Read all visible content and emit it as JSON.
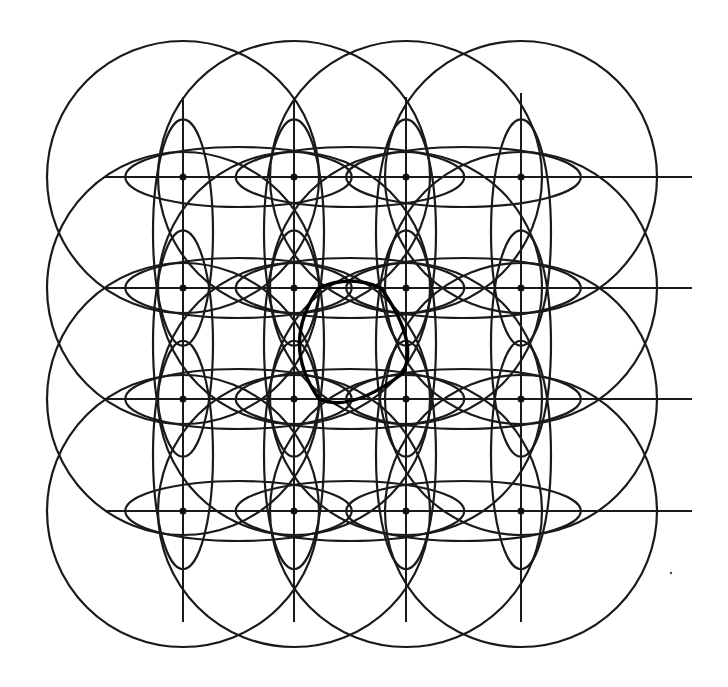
{
  "diagram": {
    "type": "geometric-construction",
    "colors": {
      "stroke": "#1a1a1a",
      "background": "#ffffff"
    },
    "grid": {
      "columns_x": [
        183,
        294,
        406,
        521
      ],
      "rows_y": [
        177,
        288,
        399,
        511
      ],
      "circle_radius": 136
    },
    "horizontal_lines": [
      {
        "y": 177,
        "x1": 105,
        "x2": 692
      },
      {
        "y": 288,
        "x1": 105,
        "x2": 692
      },
      {
        "y": 399,
        "x1": 105,
        "x2": 692
      },
      {
        "y": 511,
        "x1": 105,
        "x2": 692
      }
    ],
    "vertical_lines": [
      {
        "x": 183,
        "y1": 97,
        "y2": 622
      },
      {
        "x": 294,
        "y1": 97,
        "y2": 622
      },
      {
        "x": 406,
        "y1": 97,
        "y2": 622
      },
      {
        "x": 521,
        "y1": 93,
        "y2": 622
      }
    ],
    "emphasized_center_square": {
      "x1": 294,
      "y1": 288,
      "x2": 406,
      "y2": 399
    }
  }
}
